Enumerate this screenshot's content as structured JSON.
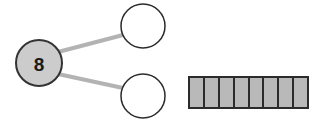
{
  "page": {
    "background_color": "#ffffff",
    "width": 321,
    "height": 124
  },
  "number_bond": {
    "name": "number-bond",
    "whole": {
      "value": "8",
      "cx": 39,
      "cy": 63,
      "r": 23,
      "fill_color": "#cccccc",
      "stroke_color": "#333333",
      "stroke_width": 2,
      "text_color": "#1a1a1a"
    },
    "parts": [
      {
        "label": "top-part",
        "value": "",
        "cx": 143,
        "cy": 26,
        "r": 22,
        "fill_color": "#ffffff",
        "stroke_color": "#2b2b2b",
        "stroke_width": 1.5
      },
      {
        "label": "bottom-part",
        "value": "",
        "cx": 143,
        "cy": 96,
        "r": 22,
        "fill_color": "#ffffff",
        "stroke_color": "#2b2b2b",
        "stroke_width": 1.5
      }
    ],
    "connectors": [
      {
        "label": "connector-to-top-part",
        "x1": 58,
        "y1": 52,
        "x2": 123,
        "y2": 35,
        "color": "#b3b3b3",
        "width": 4
      },
      {
        "label": "connector-to-bottom-part",
        "x1": 58,
        "y1": 74,
        "x2": 123,
        "y2": 88,
        "color": "#b3b3b3",
        "width": 4
      }
    ]
  },
  "bar_model": {
    "name": "bar-model",
    "cell_count": 8,
    "x": 189,
    "y": 77,
    "width": 119,
    "height": 31,
    "fill_color": "#b9b9b9",
    "divider_color": "#2b2b2b",
    "outline_color": "#2b2b2b",
    "outline_width": 2,
    "divider_width": 2
  },
  "chart_data": {
    "type": "bar",
    "title": "",
    "categories": [
      "unit 1",
      "unit 2",
      "unit 3",
      "unit 4",
      "unit 5",
      "unit 6",
      "unit 7",
      "unit 8"
    ],
    "values": [
      1,
      1,
      1,
      1,
      1,
      1,
      1,
      1
    ],
    "xlabel": "",
    "ylabel": "",
    "ylim": [
      0,
      1
    ],
    "legend": [],
    "grid": false
  }
}
